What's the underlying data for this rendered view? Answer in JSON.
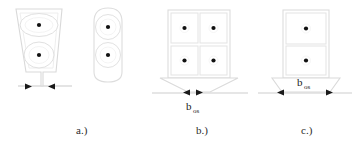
{
  "figure": {
    "background_color": "#ffffff",
    "outline_color": "#d6d6d6",
    "inner_outline_color": "#dedede",
    "ground_line_color": "#cfcfcf",
    "marker_color": "#1a1a1a",
    "dot_color": "#111111",
    "panels": [
      {
        "id": "panel-a",
        "caption": "a.)",
        "shape": "tapered-column-with-two-ellipses",
        "inclusion_count": 2,
        "arrow_direction": "inward",
        "dimension_label": "",
        "dimension_subscript": ""
      },
      {
        "id": "panel-a2",
        "caption": "",
        "shape": "narrow-rounded-column-with-two-circles",
        "inclusion_count": 2,
        "arrow_direction": "none",
        "dimension_label": "",
        "dimension_subscript": ""
      },
      {
        "id": "panel-b",
        "caption": "b.)",
        "shape": "two-by-two-block-grid",
        "inclusion_count": 4,
        "arrow_direction": "outward",
        "dimension_label": "b",
        "dimension_subscript": "os"
      },
      {
        "id": "panel-c",
        "caption": "c.)",
        "shape": "single-column-two-block-grid",
        "inclusion_count": 2,
        "arrow_direction": "outward",
        "dimension_label": "b",
        "dimension_subscript": "os"
      }
    ]
  }
}
